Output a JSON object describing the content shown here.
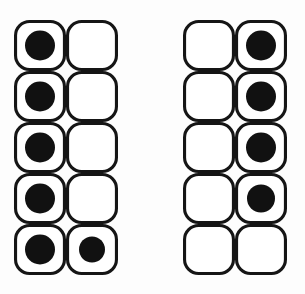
{
  "figure": {
    "canvas": {
      "width": 305,
      "height": 294,
      "background": "#fdfdfd"
    },
    "style": {
      "cell_fill": "#ffffff",
      "cell_stroke": "#151515",
      "cell_stroke_width": 3.1,
      "cell_corner_radius": 14,
      "dot_color": "#111111"
    },
    "geometry": {
      "cell_width": 52,
      "cell_height": 51,
      "rows": 5,
      "columns": 2,
      "dot_radius": 15,
      "dot_radius_small": 13
    },
    "panels": [
      {
        "id": "left-panel",
        "name": "left-grid",
        "origin_x": 14,
        "origin_y": 20,
        "rows": [
          {
            "row_index": 1,
            "cells": [
              {
                "col": 1,
                "dot": true,
                "dot_radius": 15
              },
              {
                "col": 2,
                "dot": false
              }
            ]
          },
          {
            "row_index": 2,
            "cells": [
              {
                "col": 1,
                "dot": true,
                "dot_radius": 15
              },
              {
                "col": 2,
                "dot": false
              }
            ]
          },
          {
            "row_index": 3,
            "cells": [
              {
                "col": 1,
                "dot": true,
                "dot_radius": 15
              },
              {
                "col": 2,
                "dot": false
              }
            ]
          },
          {
            "row_index": 4,
            "cells": [
              {
                "col": 1,
                "dot": true,
                "dot_radius": 15
              },
              {
                "col": 2,
                "dot": false
              }
            ]
          },
          {
            "row_index": 5,
            "cells": [
              {
                "col": 1,
                "dot": true,
                "dot_radius": 15
              },
              {
                "col": 2,
                "dot": true,
                "dot_radius": 13
              }
            ]
          }
        ],
        "dot_count": 6
      },
      {
        "id": "right-panel",
        "name": "right-grid",
        "origin_x": 183,
        "origin_y": 20,
        "rows": [
          {
            "row_index": 1,
            "cells": [
              {
                "col": 1,
                "dot": false
              },
              {
                "col": 2,
                "dot": true,
                "dot_radius": 15
              }
            ]
          },
          {
            "row_index": 2,
            "cells": [
              {
                "col": 1,
                "dot": false
              },
              {
                "col": 2,
                "dot": true,
                "dot_radius": 15
              }
            ]
          },
          {
            "row_index": 3,
            "cells": [
              {
                "col": 1,
                "dot": false
              },
              {
                "col": 2,
                "dot": true,
                "dot_radius": 15
              }
            ]
          },
          {
            "row_index": 4,
            "cells": [
              {
                "col": 1,
                "dot": false
              },
              {
                "col": 2,
                "dot": true,
                "dot_radius": 14
              }
            ]
          },
          {
            "row_index": 5,
            "cells": [
              {
                "col": 1,
                "dot": false
              },
              {
                "col": 2,
                "dot": false
              }
            ]
          }
        ],
        "dot_count": 4
      }
    ]
  }
}
